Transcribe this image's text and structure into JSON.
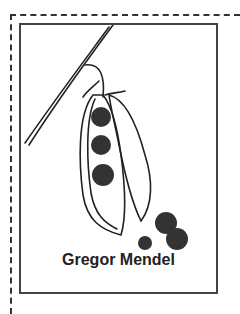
{
  "card": {
    "caption": "Gregor Mendel",
    "illustration": "pea-pod-illustration"
  }
}
